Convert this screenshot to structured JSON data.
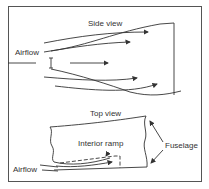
{
  "diagram": {
    "side_view": {
      "title": "Side view",
      "airflow_label": "Airflow"
    },
    "top_view": {
      "title": "Top view",
      "airflow_label": "Airflow",
      "interior_ramp_label": "Interior ramp",
      "fuselage_label": "Fuselage"
    },
    "colors": {
      "line": "#333333",
      "background": "#ffffff"
    }
  }
}
